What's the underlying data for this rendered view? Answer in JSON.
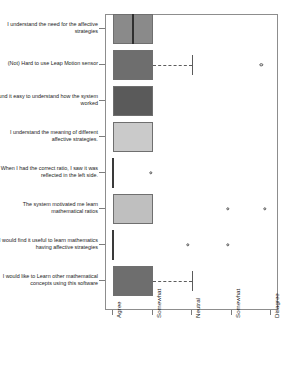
{
  "chart_data": {
    "type": "boxplot",
    "orientation": "horizontal",
    "title": "",
    "xlabel": "",
    "ylabel": "",
    "grid": false,
    "legend": false,
    "x_axis": {
      "tick_labels": [
        "Agree",
        "Somewhat",
        "Neutral",
        "Somewhat",
        "Disagree"
      ],
      "tick_values": [
        1,
        2,
        3,
        4,
        5
      ],
      "range": [
        0.6,
        5.4
      ],
      "rotation": -90
    },
    "categories": [
      "I understand the need for the affective strategies",
      "(Not) Hard to use Leap Motion sensor",
      "I found it easy to understand how the system worked",
      "I understand the meaning of different affective strategies.",
      "When I had the correct ratio, I saw it was reflected in the left side.",
      "The system motivated me learn mathematical ratios",
      "I would find it useful to learn mathematics having affective strategies",
      "I would like to Learn other mathematical concepts using this software"
    ],
    "boxes": [
      {
        "label": "I understand the need for the affective strategies",
        "q1": 1.0,
        "median": 1.5,
        "q3": 2.0,
        "whisker_low": 1.0,
        "whisker_high": 2.0,
        "outliers": [],
        "fill": "#8a8a8a",
        "degenerate": false
      },
      {
        "label": "(Not) Hard to use Leap Motion sensor",
        "q1": 1.0,
        "median": 2.0,
        "q3": 2.0,
        "whisker_low": 1.0,
        "whisker_high": 3.0,
        "outliers": [
          4.75
        ],
        "fill": "#6e6e6e",
        "degenerate": false
      },
      {
        "label": "I found it easy to understand how the system worked",
        "q1": 1.0,
        "median": 1.0,
        "q3": 2.0,
        "whisker_low": 1.0,
        "whisker_high": 2.0,
        "outliers": [],
        "fill": "#5a5a5a",
        "degenerate": false
      },
      {
        "label": "I understand the meaning of different affective strategies.",
        "q1": 1.0,
        "median": 1.0,
        "q3": 2.0,
        "whisker_low": 1.0,
        "whisker_high": 2.0,
        "outliers": [],
        "fill": "#cacaca",
        "degenerate": false
      },
      {
        "label": "When I had the correct ratio, I saw it was reflected in the left side.",
        "q1": 1.0,
        "median": 1.0,
        "q3": 1.0,
        "whisker_low": 1.0,
        "whisker_high": 1.0,
        "outliers": [
          1.95
        ],
        "fill": "#3a3a3a",
        "degenerate": true
      },
      {
        "label": "The system motivated me learn mathematical ratios",
        "q1": 1.0,
        "median": 1.0,
        "q3": 2.0,
        "whisker_low": 1.0,
        "whisker_high": 2.0,
        "outliers": [
          3.9,
          4.85
        ],
        "fill": "#bfbfbf",
        "degenerate": false
      },
      {
        "label": "I would find it useful to learn mathematics having affective strategies",
        "q1": 1.0,
        "median": 1.0,
        "q3": 1.0,
        "whisker_low": 1.0,
        "whisker_high": 1.0,
        "outliers": [
          2.9,
          3.9
        ],
        "fill": "#3a3a3a",
        "degenerate": true
      },
      {
        "label": "I would like to Learn other mathematical concepts using this software",
        "q1": 1.0,
        "median": 1.0,
        "q3": 2.0,
        "whisker_low": 1.0,
        "whisker_high": 3.0,
        "outliers": [],
        "fill": "#6e6e6e",
        "degenerate": false
      }
    ],
    "colors": {
      "frame": "#8d8d8d",
      "box_border": "#6f6f6f",
      "median": "#2f2f2f",
      "whisker": "#5c5c5c",
      "outlier": "#555555",
      "background": "#ffffff"
    }
  }
}
